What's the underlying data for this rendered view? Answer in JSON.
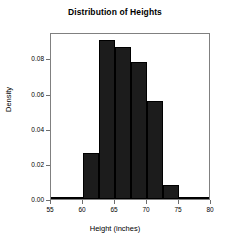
{
  "chart_data": {
    "type": "bar",
    "title": "Distribution of Heights",
    "xlabel": "Height (inches)",
    "ylabel": "Density",
    "xlim": [
      55,
      80
    ],
    "ylim": [
      0.0,
      0.095
    ],
    "xticks": [
      "55",
      "60",
      "65",
      "70",
      "75",
      "80"
    ],
    "xtick_values": [
      55,
      60,
      65,
      70,
      75,
      80
    ],
    "yticks": [
      "0.00",
      "0.02",
      "0.04",
      "0.06",
      "0.08"
    ],
    "ytick_values": [
      0.0,
      0.02,
      0.04,
      0.06,
      0.08
    ],
    "grid": false,
    "legend": null,
    "bar_color": "#1c1c1c",
    "bin_edges": [
      55,
      60,
      62.5,
      65,
      67.5,
      70,
      72.5,
      75,
      80
    ],
    "bins": [
      {
        "x0": 55,
        "x1": 60,
        "density": 0.001
      },
      {
        "x0": 60,
        "x1": 62.5,
        "density": 0.026
      },
      {
        "x0": 62.5,
        "x1": 65,
        "density": 0.0905
      },
      {
        "x0": 65,
        "x1": 67.5,
        "density": 0.0865
      },
      {
        "x0": 67.5,
        "x1": 70,
        "density": 0.078
      },
      {
        "x0": 70,
        "x1": 72.5,
        "density": 0.056
      },
      {
        "x0": 72.5,
        "x1": 75,
        "density": 0.008
      },
      {
        "x0": 75,
        "x1": 80,
        "density": 0.001
      }
    ],
    "categories": [
      "55-60",
      "60-62.5",
      "62.5-65",
      "65-67.5",
      "67.5-70",
      "70-72.5",
      "72.5-75",
      "75-80"
    ],
    "values": [
      0.001,
      0.026,
      0.0905,
      0.0865,
      0.078,
      0.056,
      0.008,
      0.001
    ]
  }
}
